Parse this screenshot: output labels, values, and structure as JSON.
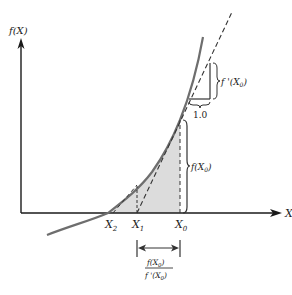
{
  "diagram": {
    "y_axis_label": "f(X)",
    "x_axis_label": "X",
    "points": [
      {
        "name": "X2",
        "base": "X",
        "sub": "2"
      },
      {
        "name": "X1",
        "base": "X",
        "sub": "1"
      },
      {
        "name": "X0",
        "base": "X",
        "sub": "0"
      }
    ],
    "annotations": {
      "derivative": {
        "prefix": "f '(X",
        "sub": "0",
        "suffix": ")"
      },
      "run": "1.0",
      "function_value": {
        "prefix": "f(X",
        "sub": "0",
        "suffix": ")"
      },
      "step_numerator": {
        "prefix": "f(X",
        "sub": "0",
        "suffix": ")"
      },
      "step_denominator": {
        "prefix": "f '(X",
        "sub": "0",
        "suffix": ")"
      }
    },
    "colors": {
      "axis": "#1a1a1a",
      "curve": "#6e6e6e",
      "shade": "#dcdcdc",
      "tangent": "#333333"
    }
  }
}
